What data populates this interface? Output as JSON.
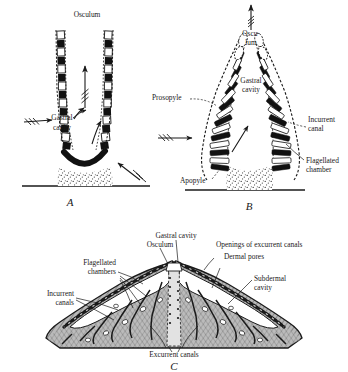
{
  "figure": {
    "colors": {
      "ink": "#1a1a1a",
      "background": "#ffffff",
      "mesenchyme_fill": "#9a9a9a",
      "stipple": "#6f6f6f"
    },
    "panels": [
      {
        "id": "A",
        "letter": "A",
        "type": "asconoid",
        "labels": [
          {
            "name": "osculum",
            "text": "Osculum"
          },
          {
            "name": "gastral-cavity",
            "text": "Gastral\ncavity",
            "line1": "Gastral",
            "line2": "cavity"
          }
        ],
        "flow_arrows": 5
      },
      {
        "id": "B",
        "letter": "B",
        "type": "syconoid",
        "labels": [
          {
            "name": "osculum",
            "text": "Oscu-\nlum",
            "line1": "Oscu-",
            "line2": "lum"
          },
          {
            "name": "gastral-cavity",
            "text": "Gastral\ncavity",
            "line1": "Gastral",
            "line2": "cavity"
          },
          {
            "name": "prosopyle",
            "text": "Prosopyle"
          },
          {
            "name": "incurrent-canal",
            "text": "Incurrent\ncanal",
            "line1": "Incurrent",
            "line2": "canal"
          },
          {
            "name": "flagellated-chamber",
            "text": "Flagellated\nchamber",
            "line1": "Flagellated",
            "line2": "chamber"
          },
          {
            "name": "apopyle",
            "text": "Apopyle"
          }
        ],
        "flow_arrows": 4
      },
      {
        "id": "C",
        "letter": "C",
        "type": "leuconoid",
        "labels": [
          {
            "name": "gastral-cavity",
            "text": "Gastral cavity"
          },
          {
            "name": "osculum",
            "text": "Osculum"
          },
          {
            "name": "openings-of-excurrent-canals",
            "text": "Openings of excurrent canals"
          },
          {
            "name": "dermal-pores",
            "text": "Dermal pores"
          },
          {
            "name": "flagellated-chambers",
            "text": "Flagellated\nchambers",
            "line1": "Flagellated",
            "line2": "chambers"
          },
          {
            "name": "subdermal-cavity",
            "text": "Subdermal\ncavity",
            "line1": "Subdermal",
            "line2": "cavity"
          },
          {
            "name": "incurrent-canals",
            "text": "Incurrent\ncanals",
            "line1": "Incurrent",
            "line2": "canals"
          },
          {
            "name": "excurrent-canals",
            "text": "Excurrent canals"
          }
        ]
      }
    ]
  },
  "panelA": {
    "osculum": "Osculum",
    "gastral_cavity_l1": "Gastral",
    "gastral_cavity_l2": "cavity",
    "letter": "A"
  },
  "panelB": {
    "osculum_l1": "Oscu-",
    "osculum_l2": "lum",
    "gastral_cavity_l1": "Gastral",
    "gastral_cavity_l2": "cavity",
    "prosopyle": "Prosopyle",
    "incurrent_canal_l1": "Incurrent",
    "incurrent_canal_l2": "canal",
    "flagellated_chamber_l1": "Flagellated",
    "flagellated_chamber_l2": "chamber",
    "apopyle": "Apopyle",
    "letter": "B"
  },
  "panelC": {
    "gastral_cavity": "Gastral cavity",
    "osculum": "Osculum",
    "openings_excurrent": "Openings of excurrent canals",
    "dermal_pores": "Dermal pores",
    "flagellated_chambers_l1": "Flagellated",
    "flagellated_chambers_l2": "chambers",
    "subdermal_cavity_l1": "Subdermal",
    "subdermal_cavity_l2": "cavity",
    "incurrent_canals_l1": "Incurrent",
    "incurrent_canals_l2": "canals",
    "excurrent_canals": "Excurrent canals",
    "letter": "C"
  }
}
